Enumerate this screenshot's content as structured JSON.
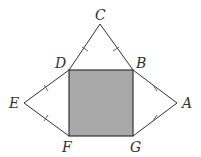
{
  "diagram": {
    "type": "geometry-figure",
    "colors": {
      "square_fill": "#a9a9a9",
      "stroke": "#333333",
      "background": "#ffffff"
    },
    "points": {
      "C": {
        "label": "C",
        "x": 100,
        "y": 24
      },
      "D": {
        "label": "D",
        "x": 69,
        "y": 70
      },
      "B": {
        "label": "B",
        "x": 133,
        "y": 70
      },
      "E": {
        "label": "E",
        "x": 24,
        "y": 103
      },
      "A": {
        "label": "A",
        "x": 177,
        "y": 103
      },
      "F": {
        "label": "F",
        "x": 69,
        "y": 136
      },
      "G": {
        "label": "G",
        "x": 133,
        "y": 136
      }
    },
    "shaded_region": "square DBGF",
    "tick_marked_segments": [
      "CD",
      "CB",
      "ED",
      "EF",
      "AB",
      "AG"
    ]
  }
}
